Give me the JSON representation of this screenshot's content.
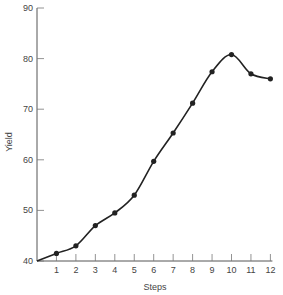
{
  "chart_data": {
    "type": "line",
    "title": "",
    "xlabel": "Steps",
    "ylabel": "Yield",
    "x": [
      0,
      1,
      2,
      3,
      4,
      5,
      6,
      7,
      8,
      9,
      10,
      11,
      12
    ],
    "series": [
      {
        "name": "Yield",
        "values": [
          40,
          41.5,
          43,
          47,
          49.5,
          53,
          59.7,
          65.3,
          71.2,
          77.4,
          80.8,
          77,
          76
        ],
        "markers_from_index": 1
      }
    ],
    "xticks": [
      "1",
      "2",
      "3",
      "4",
      "5",
      "6",
      "7",
      "8",
      "9",
      "10",
      "11",
      "12"
    ],
    "yticks": [
      "40",
      "50",
      "60",
      "70",
      "80",
      "90"
    ],
    "xlim": [
      0,
      12
    ],
    "ylim": [
      40,
      90
    ],
    "grid": false,
    "legend": "none"
  }
}
